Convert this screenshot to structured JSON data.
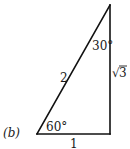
{
  "figure": {
    "panel_label": "(b)",
    "shape": "right-triangle",
    "vertices": {
      "bottom_left": [
        37,
        134
      ],
      "bottom_right": [
        110,
        134
      ],
      "top": [
        110,
        5
      ]
    },
    "sides": {
      "hypotenuse": "2",
      "base": "1",
      "height_radical": "√",
      "height_value": "3"
    },
    "angles": {
      "bottom_left": "60°",
      "top": "30°"
    },
    "colors": {
      "stroke": "#111111",
      "text": "#1a1a1a",
      "background": "#ffffff"
    }
  }
}
